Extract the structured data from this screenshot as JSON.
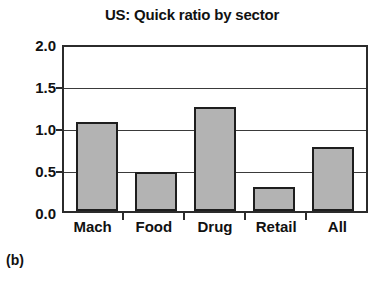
{
  "figure": {
    "subfigure_label": "(b)",
    "background_color": "#ffffff"
  },
  "chart_data": {
    "type": "bar",
    "title": "US: Quick ratio by sector",
    "xlabel": "",
    "ylabel": "",
    "categories": [
      "Mach",
      "Food",
      "Drug",
      "Retail",
      "All"
    ],
    "values": [
      1.08,
      0.47,
      1.27,
      0.29,
      0.78
    ],
    "ylim": [
      0.0,
      2.0
    ],
    "ytick_labels": [
      "0.0",
      "0.5",
      "1.0",
      "1.5",
      "2.0"
    ],
    "ytick_values": [
      0.0,
      0.5,
      1.0,
      1.5,
      2.0
    ],
    "grid": true,
    "grid_axis": "y",
    "legend": false,
    "legend_position": "none",
    "bar_fill_color": "#b3b3b3",
    "bar_edge_color": "#1e1e1e",
    "axis_color": "#2b2b2b",
    "text_color": "#111111"
  }
}
